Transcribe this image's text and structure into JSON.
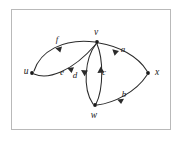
{
  "figure": {
    "type": "directed-multigraph",
    "caption": "",
    "background_color": "#ffffff",
    "frame_color": "#b9b9b9",
    "ink_color": "#2b2b2b",
    "vertices": [
      {
        "id": "u",
        "label": "u",
        "x": 32,
        "y": 73,
        "label_x": 26,
        "label_y": 72
      },
      {
        "id": "v",
        "label": "v",
        "x": 97,
        "y": 42,
        "label_x": 96,
        "label_y": 33
      },
      {
        "id": "w",
        "label": "w",
        "x": 95,
        "y": 105,
        "label_x": 94,
        "label_y": 116
      },
      {
        "id": "x",
        "label": "x",
        "x": 148,
        "y": 73,
        "label_x": 157,
        "label_y": 73
      }
    ],
    "edges": [
      {
        "id": "f",
        "label": "f",
        "from": "u",
        "to": "v",
        "label_x": 57,
        "label_y": 40
      },
      {
        "id": "e",
        "label": "e",
        "from": "u",
        "to": "v",
        "label_x": 62,
        "label_y": 73
      },
      {
        "id": "d",
        "label": "d",
        "from": "v",
        "to": "w",
        "label_x": 75,
        "label_y": 76
      },
      {
        "id": "c",
        "label": "c",
        "from": "w",
        "to": "v",
        "label_x": 104,
        "label_y": 73
      },
      {
        "id": "a",
        "label": "a",
        "from": "v",
        "to": "x",
        "label_x": 123,
        "label_y": 50
      },
      {
        "id": "b",
        "label": "b",
        "from": "w",
        "to": "x",
        "label_x": 124,
        "label_y": 95
      }
    ]
  }
}
